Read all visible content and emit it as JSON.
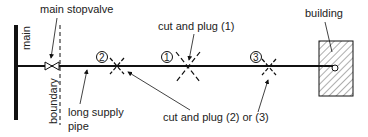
{
  "diagram": {
    "labels": {
      "main": "main",
      "main_stopvalve": "main stopvalve",
      "boundary": "boundary",
      "long_supply_pipe_line1": "long supply",
      "long_supply_pipe_line2": "pipe",
      "cut_and_plug_1": "cut and plug (1)",
      "cut_and_plug_2_or_3": "cut and plug (2) or (3)",
      "building": "building"
    },
    "markers": [
      {
        "id": "2",
        "label": "2"
      },
      {
        "id": "1",
        "label": "1"
      },
      {
        "id": "3",
        "label": "3"
      }
    ],
    "colors": {
      "line": "#111111",
      "text": "#222222",
      "background": "#ffffff"
    }
  }
}
